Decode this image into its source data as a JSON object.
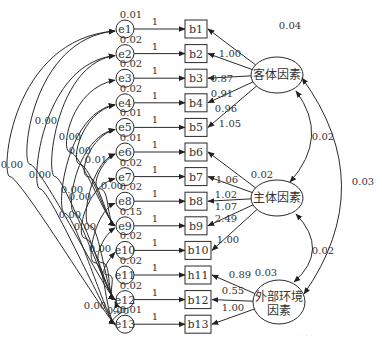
{
  "diagram": {
    "type": "structural-equation-model",
    "error_terms": [
      {
        "id": "e1",
        "variance": "0.01"
      },
      {
        "id": "e2",
        "variance": "0.02"
      },
      {
        "id": "e3",
        "variance": "0.02"
      },
      {
        "id": "e4",
        "variance": "0.02"
      },
      {
        "id": "e5",
        "variance": "0.01"
      },
      {
        "id": "e6",
        "variance": "0.01"
      },
      {
        "id": "e7",
        "variance": "0.02"
      },
      {
        "id": "e8",
        "variance": "0.02"
      },
      {
        "id": "e9",
        "variance": "0.15"
      },
      {
        "id": "e10",
        "variance": "0.02"
      },
      {
        "id": "e11",
        "variance": "0.02"
      },
      {
        "id": "e12",
        "variance": "0.02"
      },
      {
        "id": "e13",
        "variance": "0.01"
      }
    ],
    "error_path_label": "1",
    "observed": [
      "b1",
      "b2",
      "b3",
      "b4",
      "b5",
      "b6",
      "b7",
      "b8",
      "b9",
      "b10",
      "h11",
      "b12",
      "b13"
    ],
    "latent": [
      {
        "name": "客体因素",
        "variance": "0.04",
        "indicators": [
          "b1",
          "b2",
          "b3",
          "b4",
          "b5"
        ],
        "loadings": [
          "",
          "1.00",
          "0.87",
          "0.91",
          "0.96",
          "1.05"
        ]
      },
      {
        "name": "主体因素",
        "variance": "0.02",
        "indicators": [
          "b6",
          "b7",
          "b8",
          "b9",
          "b10"
        ],
        "loadings": [
          "1.06",
          "1.02",
          "1.07",
          "2.49",
          "1.00"
        ]
      },
      {
        "name_line1": "外部环境",
        "name_line2": "因素",
        "variance": "0.03",
        "indicators": [
          "h11",
          "b12",
          "b13"
        ],
        "loadings": [
          "0.89",
          "0.55",
          "1.00"
        ]
      }
    ],
    "latent_covariances": [
      {
        "from": "客体因素",
        "to": "主体因素",
        "value": "0.02"
      },
      {
        "from": "主体因素",
        "to": "外部环境因素",
        "value": "0.02"
      },
      {
        "from": "客体因素",
        "to": "外部环境因素",
        "value": "0.03"
      }
    ],
    "error_covariance_labels": [
      "0.00",
      "0.00",
      "0.00",
      "0.00",
      "0.00",
      "0.01",
      "0.00",
      "0.00",
      "0.00",
      "0.00",
      "0.00",
      "0.00",
      "0.00",
      "0.00"
    ]
  }
}
